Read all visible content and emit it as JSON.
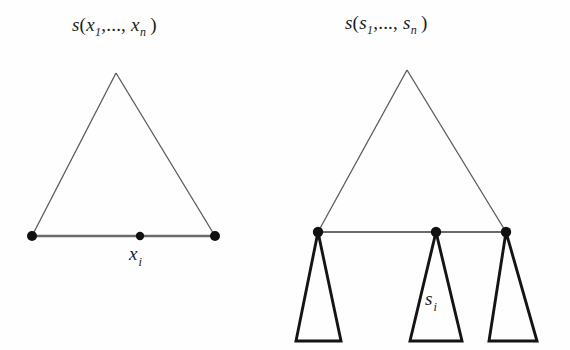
{
  "figure": {
    "background_color": "#fefefe",
    "ink_color": "#1c1c1c",
    "thin_stroke_color": "#555555",
    "left_panel": {
      "formula": {
        "fn": "s",
        "open": "(",
        "arg_first_base": "x",
        "arg_first_sub": "1",
        "ellipsis": ",...,",
        "arg_last_base": "x",
        "arg_last_sub": "n",
        "close": ")"
      },
      "node_label": {
        "base": "x",
        "sub": "i"
      },
      "triangle": {
        "apex": [
          116,
          73
        ],
        "base_left": [
          32,
          236
        ],
        "base_right": [
          215,
          236
        ]
      },
      "base_nodes": [
        {
          "name": "left-endpoint",
          "x": 32,
          "y": 236,
          "r": 5
        },
        {
          "name": "middle-node",
          "x": 140,
          "y": 236,
          "r": 4
        },
        {
          "name": "right-endpoint",
          "x": 215,
          "y": 236,
          "r": 5
        }
      ]
    },
    "right_panel": {
      "formula": {
        "fn": "s",
        "open": "(",
        "arg_first_base": "s",
        "arg_first_sub": "1",
        "ellipsis": ",...,",
        "arg_last_base": "s",
        "arg_last_sub": "n",
        "close": ")"
      },
      "node_label": {
        "base": "s",
        "sub": "i"
      },
      "triangle": {
        "apex": [
          407,
          70
        ],
        "base_left": [
          318,
          232
        ],
        "base_right": [
          506,
          232
        ]
      },
      "base_nodes": [
        {
          "name": "left-endpoint",
          "x": 318,
          "y": 232,
          "r": 5
        },
        {
          "name": "middle-node",
          "x": 436,
          "y": 232,
          "r": 5
        },
        {
          "name": "right-endpoint",
          "x": 506,
          "y": 232,
          "r": 5
        }
      ],
      "subtrees": [
        {
          "name": "left-subtree",
          "apex": [
            318,
            232
          ],
          "base_left": [
            296,
            341
          ],
          "base_right": [
            341,
            341
          ]
        },
        {
          "name": "middle-subtree",
          "apex": [
            436,
            232
          ],
          "base_left": [
            410,
            341
          ],
          "base_right": [
            462,
            341
          ]
        },
        {
          "name": "right-subtree",
          "apex": [
            506,
            232
          ],
          "base_left": [
            489,
            341
          ],
          "base_right": [
            537,
            341
          ]
        }
      ]
    }
  }
}
